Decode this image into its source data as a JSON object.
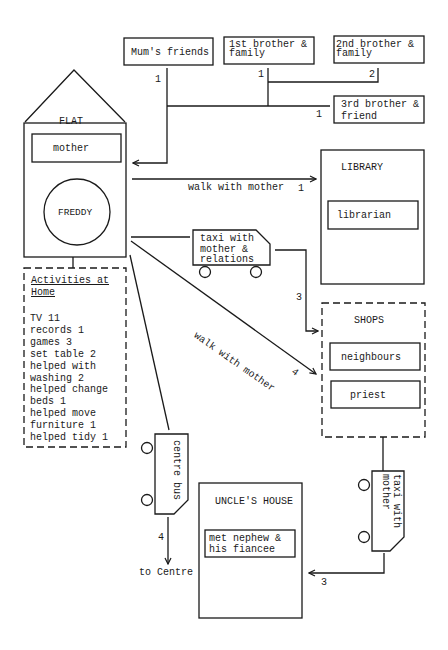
{
  "diagram": {
    "type": "social network / movement map",
    "nodes": {
      "flat": {
        "title": "FLAT",
        "occupant": "mother",
        "centre": "FREDDY"
      },
      "mums_friends": {
        "label": "Mum's friends"
      },
      "brother1": {
        "label": "1st brother &\nfamily"
      },
      "brother2": {
        "label": "2nd brother &\nfamily"
      },
      "brother3": {
        "label": "3rd brother &\nfriend"
      },
      "library": {
        "title": "LIBRARY",
        "person": "librarian"
      },
      "shops": {
        "title": "SHOPS",
        "people": [
          "neighbours",
          "priest"
        ]
      },
      "uncles_house": {
        "title": "UNCLE'S HOUSE",
        "person": "met nephew &\nhis fiancee"
      },
      "taxi1": {
        "label": "taxi with\nmother &\nrelations"
      },
      "taxi2": {
        "label": "taxi with\nmother"
      },
      "bus": {
        "label": "centre bus"
      },
      "to_centre": {
        "label": "to Centre"
      }
    },
    "activities": {
      "title_line1": "Activities at",
      "title_line2": "Home",
      "items": [
        "TV 11",
        "records 1",
        "games 3",
        "set table 2",
        "helped with",
        "washing 2",
        "helped change",
        "beds 1",
        "helped move",
        "furniture 1",
        "helped tidy 1"
      ]
    },
    "edges": {
      "mums_friends_count": "1",
      "brother1_count": "1",
      "brother2_count": "2",
      "brother3_count": "1",
      "walk_library_label": "walk with mother",
      "walk_library_count": "1",
      "taxi_shops_count": "3",
      "walk_shops_label": "walk with mother",
      "walk_shops_count": "4",
      "bus_count": "4",
      "taxi_uncle_count": "3"
    }
  }
}
